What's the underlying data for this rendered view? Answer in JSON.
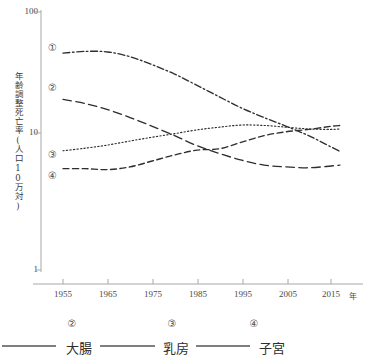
{
  "chart_data": {
    "type": "line",
    "title": "",
    "xlabel": "年",
    "ylabel": "年齢調整死亡率(人口10万対)",
    "yscale": "log",
    "ylim": [
      1,
      100
    ],
    "ytick_labels": [
      "100",
      "10",
      "1"
    ],
    "ytick_values": [
      100,
      10,
      1
    ],
    "xlim": [
      1950,
      2017
    ],
    "xtick_labels": [
      "1955",
      "1965",
      "1975",
      "1985",
      "1995",
      "2005",
      "2015"
    ],
    "xtick_values": [
      1955,
      1965,
      1975,
      1985,
      1995,
      2005,
      2015
    ],
    "grid": false,
    "legend_position": "bottom",
    "x": [
      1955,
      1960,
      1965,
      1970,
      1975,
      1980,
      1985,
      1990,
      1995,
      2000,
      2005,
      2010,
      2015,
      2017
    ],
    "series": [
      {
        "name": "①",
        "label": "",
        "marker_number": "①",
        "linestyle": "dash-dot",
        "values": [
          48.0,
          49.5,
          49.0,
          45.0,
          39.0,
          33.0,
          27.0,
          22.0,
          18.0,
          15.2,
          13.0,
          11.0,
          9.0,
          8.3
        ]
      },
      {
        "name": "②",
        "label": "大腸",
        "marker_number": "②",
        "linestyle": "long-dash",
        "values": [
          21.0,
          19.5,
          17.5,
          15.2,
          13.0,
          11.0,
          9.2,
          8.0,
          7.1,
          6.5,
          6.3,
          6.2,
          6.4,
          6.5
        ]
      },
      {
        "name": "③",
        "label": "乳房",
        "marker_number": "③",
        "linestyle": "dotted",
        "values": [
          8.4,
          8.8,
          9.3,
          10.0,
          10.7,
          11.4,
          12.2,
          12.8,
          13.3,
          13.2,
          12.8,
          12.4,
          12.3,
          12.4
        ]
      },
      {
        "name": "④",
        "label": "子宮",
        "marker_number": "④",
        "linestyle": "dashed",
        "values": [
          6.1,
          6.1,
          6.0,
          6.3,
          7.0,
          7.8,
          8.5,
          8.7,
          9.8,
          11.0,
          11.8,
          12.3,
          13.0,
          13.2
        ]
      }
    ]
  },
  "axis": {
    "y_title": "年齢調整死亡率(人口10万対)",
    "y_ticks": [
      {
        "label": "100"
      },
      {
        "label": "10"
      },
      {
        "label": "1"
      }
    ],
    "x_ticks": [
      {
        "label": "1955"
      },
      {
        "label": "1965"
      },
      {
        "label": "1975"
      },
      {
        "label": "1985"
      },
      {
        "label": "1995"
      },
      {
        "label": "2005"
      },
      {
        "label": "2015"
      }
    ],
    "x_unit": "年"
  },
  "plot_markers": [
    {
      "text": "①"
    },
    {
      "text": "②"
    },
    {
      "text": "③"
    },
    {
      "text": "④"
    }
  ],
  "legend": {
    "entries": [
      {
        "number": "②",
        "label": "大腸"
      },
      {
        "number": "③",
        "label": "乳房"
      },
      {
        "number": "④",
        "label": "子宮"
      }
    ]
  },
  "colors": {
    "line": "#2e2e2e",
    "axis": "#9a9a9a",
    "text": "#3a3a3a"
  }
}
